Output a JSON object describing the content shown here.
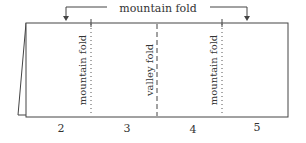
{
  "diagram": {
    "top_label": "mountain fold",
    "folds": [
      {
        "label": "mountain fold",
        "style": "dotted",
        "x": 91
      },
      {
        "label": "valley fold",
        "style": "dashed",
        "x": 157
      },
      {
        "label": "mountain fold",
        "style": "dotted",
        "x": 222
      }
    ],
    "panel_numbers": [
      "2",
      "3",
      "4",
      "5"
    ],
    "colors": {
      "line": "#444444",
      "text": "#333333"
    }
  }
}
